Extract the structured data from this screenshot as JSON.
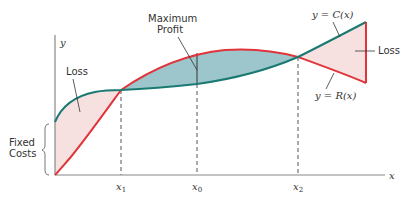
{
  "diagram": {
    "axes": {
      "x_label": "x",
      "y_label": "y"
    },
    "x_ticks": [
      {
        "name": "x1",
        "base": "x",
        "sub": "1"
      },
      {
        "name": "x0",
        "base": "x",
        "sub": "0"
      },
      {
        "name": "x2",
        "base": "x",
        "sub": "2"
      }
    ],
    "curves": {
      "cost": {
        "label": "y = C(x)",
        "color": "#1a7a73"
      },
      "revenue": {
        "label": "y = R(x)",
        "color": "#e0343a"
      }
    },
    "annotations": {
      "max_profit_line1": "Maximum",
      "max_profit_line2": "Profit",
      "loss_left": "Loss",
      "loss_right": "Loss",
      "fixed_costs_line1": "Fixed",
      "fixed_costs_line2": "Costs"
    },
    "colors": {
      "profit_fill": "#9cc6cc",
      "loss_fill": "#f7e1e0",
      "axis": "#888888",
      "text": "#333333"
    }
  }
}
